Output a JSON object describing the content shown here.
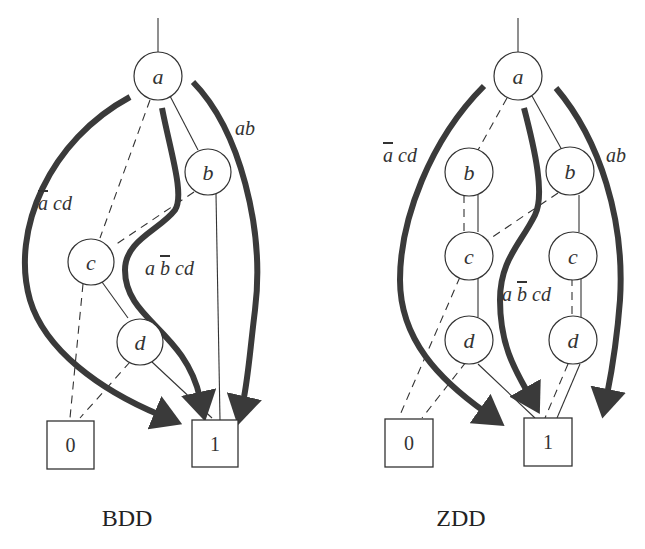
{
  "diagrams": [
    {
      "id": "bdd",
      "caption": "BDD",
      "nodes": [
        {
          "id": "a",
          "label": "a"
        },
        {
          "id": "b",
          "label": "b"
        },
        {
          "id": "c",
          "label": "c"
        },
        {
          "id": "d",
          "label": "d"
        }
      ],
      "terminals": [
        {
          "label": "0"
        },
        {
          "label": "1"
        }
      ],
      "paths": [
        {
          "label_prefix": "",
          "overbar_var": "a",
          "label_suffix": " cd",
          "text": "ā cd"
        },
        {
          "label_prefix": "a ",
          "overbar_var": "b",
          "label_suffix": " cd",
          "text": "a b̄ cd"
        },
        {
          "label_prefix": "ab",
          "overbar_var": "",
          "label_suffix": "",
          "text": "ab"
        }
      ]
    },
    {
      "id": "zdd",
      "caption": "ZDD",
      "nodes": [
        {
          "id": "a",
          "label": "a"
        },
        {
          "id": "b1",
          "label": "b"
        },
        {
          "id": "b2",
          "label": "b"
        },
        {
          "id": "c1",
          "label": "c"
        },
        {
          "id": "c2",
          "label": "c"
        },
        {
          "id": "d1",
          "label": "d"
        },
        {
          "id": "d2",
          "label": "d"
        }
      ],
      "terminals": [
        {
          "label": "0"
        },
        {
          "label": "1"
        }
      ],
      "paths": [
        {
          "label_prefix": "",
          "overbar_var": "a",
          "label_suffix": " cd",
          "text": "ā cd"
        },
        {
          "label_prefix": "a ",
          "overbar_var": "b",
          "label_suffix": " cd",
          "text": "a b̄ cd"
        },
        {
          "label_prefix": "ab",
          "overbar_var": "",
          "label_suffix": "",
          "text": "ab"
        }
      ]
    }
  ],
  "legend": {
    "solid_edge": "high (1) edge",
    "dashed_edge": "low (0) edge",
    "thick_arrow": "path to terminal 1"
  },
  "colors": {
    "stroke": "#333333",
    "arrow": "#3a3a3a",
    "background": "#ffffff"
  }
}
